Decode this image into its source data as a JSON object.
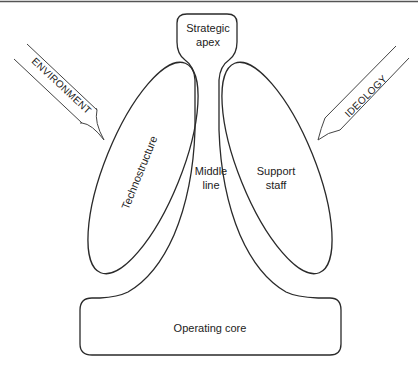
{
  "diagram": {
    "type": "organizational-configuration",
    "parts": {
      "strategic_apex": {
        "line1": "Strategic",
        "line2": "apex"
      },
      "middle_line": {
        "line1": "Middle",
        "line2": "line"
      },
      "technostructure": {
        "label": "Technostructure"
      },
      "support_staff": {
        "line1": "Support",
        "line2": "staff"
      },
      "operating_core": {
        "label": "Operating core"
      }
    },
    "forces": {
      "left": {
        "label": "ENVIRONMENT"
      },
      "right": {
        "label": "IDEOLOGY"
      }
    },
    "colors": {
      "line": "#2a2a2a",
      "background": "#ffffff",
      "top_rule": "#555555"
    }
  }
}
